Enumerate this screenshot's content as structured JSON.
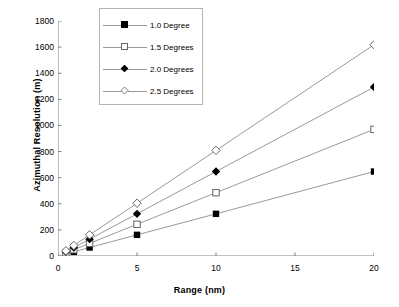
{
  "chart_data": {
    "type": "line",
    "title": "",
    "xlabel": "Range (nm)",
    "ylabel": "Azimuthal Resolution (m)",
    "xlim": [
      0,
      20
    ],
    "ylim": [
      0,
      1800
    ],
    "xticks": [
      0,
      5,
      10,
      15,
      20
    ],
    "yticks": [
      0,
      200,
      400,
      600,
      800,
      1000,
      1200,
      1400,
      1600,
      1800
    ],
    "grid": false,
    "legend_position": "top-center",
    "x": [
      0.5,
      1,
      2,
      5,
      10,
      20
    ],
    "series": [
      {
        "name": "1.0 Degree",
        "marker": "square-filled",
        "values": [
          16,
          32,
          65,
          162,
          323,
          647
        ]
      },
      {
        "name": "1.5 Degrees",
        "marker": "square-open",
        "values": [
          24,
          48,
          97,
          243,
          485,
          970
        ]
      },
      {
        "name": "2.0 Degrees",
        "marker": "diamond-filled",
        "values": [
          32,
          65,
          129,
          323,
          647,
          1294
        ]
      },
      {
        "name": "2.5 Degrees",
        "marker": "diamond-open",
        "values": [
          40,
          81,
          162,
          404,
          809,
          1618
        ]
      }
    ]
  },
  "axis": {
    "y_title": "Azimuthal Resolution (m)",
    "x_title": "Range (nm)",
    "y_tick_labels": [
      "1800",
      "1600",
      "1400",
      "1200",
      "1000",
      "800",
      "600",
      "400",
      "200",
      "0"
    ],
    "x_tick_labels": [
      "0",
      "5",
      "10",
      "15",
      "20"
    ]
  },
  "legend": {
    "entries": [
      {
        "label": "1.0 Degree",
        "marker": "square-filled"
      },
      {
        "label": "1.5 Degrees",
        "marker": "square-open"
      },
      {
        "label": "2.0 Degrees",
        "marker": "diamond-filled"
      },
      {
        "label": "2.5 Degrees",
        "marker": "diamond-open"
      }
    ]
  },
  "colors": {
    "line": "#999999",
    "axis": "#808080",
    "marker_fill": "#000000",
    "marker_open_stroke": "#666666",
    "legend_border": "#b4b4b4",
    "background": "#ffffff"
  }
}
